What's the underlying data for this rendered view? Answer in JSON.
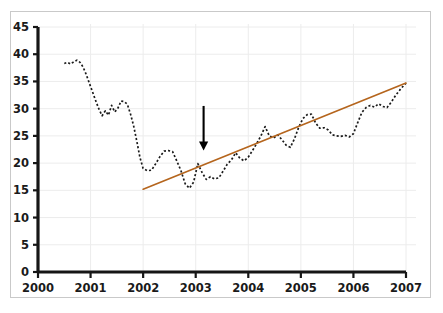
{
  "chart_data": {
    "type": "line",
    "title": "",
    "subtitle": "",
    "xlabel": "",
    "ylabel": "",
    "xlim": [
      2000,
      2007
    ],
    "ylim": [
      0,
      45
    ],
    "grid": true,
    "legend": "none",
    "x_ticks": [
      "2000",
      "2001",
      "2002",
      "2003",
      "2004",
      "2005",
      "2006",
      "2007"
    ],
    "y_ticks": [
      "0",
      "5",
      "10",
      "15",
      "20",
      "25",
      "30",
      "35",
      "40",
      "45"
    ],
    "series": [
      {
        "name": "data-series",
        "style": "dotted",
        "color": "#1a1a1a",
        "x": [
          2000.5,
          2000.56,
          2000.62,
          2000.68,
          2000.74,
          2000.8,
          2000.86,
          2000.92,
          2000.98,
          2001.04,
          2001.1,
          2001.16,
          2001.22,
          2001.28,
          2001.34,
          2001.4,
          2001.46,
          2001.52,
          2001.58,
          2001.64,
          2001.7,
          2001.76,
          2001.82,
          2001.88,
          2001.94,
          2002.0,
          2002.08,
          2002.16,
          2002.24,
          2002.32,
          2002.4,
          2002.48,
          2002.56,
          2002.64,
          2002.72,
          2002.8,
          2002.88,
          2002.96,
          2003.04,
          2003.12,
          2003.2,
          2003.28,
          2003.36,
          2003.44,
          2003.52,
          2003.6,
          2003.68,
          2003.76,
          2003.84,
          2003.92,
          2004.0,
          2004.08,
          2004.16,
          2004.24,
          2004.32,
          2004.4,
          2004.48,
          2004.56,
          2004.64,
          2004.72,
          2004.8,
          2004.88,
          2004.96,
          2005.04,
          2005.12,
          2005.2,
          2005.28,
          2005.36,
          2005.44,
          2005.52,
          2005.6,
          2005.68,
          2005.76,
          2005.84,
          2005.92,
          2006.0,
          2006.08,
          2006.16,
          2006.24,
          2006.32,
          2006.4,
          2006.48,
          2006.56,
          2006.64,
          2006.72,
          2006.8,
          2006.88,
          2006.96,
          2007.0
        ],
        "y": [
          38.3,
          38.5,
          38.2,
          38.6,
          38.9,
          38.5,
          37.6,
          36.2,
          34.6,
          33.0,
          31.4,
          29.9,
          28.7,
          29.6,
          28.8,
          30.6,
          29.4,
          30.1,
          31.4,
          31.3,
          30.8,
          29.0,
          26.8,
          24.0,
          21.0,
          19.0,
          18.6,
          18.7,
          19.9,
          21.2,
          22.2,
          22.3,
          22.1,
          20.4,
          18.6,
          16.2,
          15.4,
          16.5,
          19.9,
          18.3,
          17.0,
          17.5,
          17.1,
          17.3,
          18.5,
          19.8,
          20.6,
          21.9,
          20.9,
          20.4,
          21.1,
          22.3,
          23.6,
          25.0,
          26.7,
          25.0,
          24.6,
          25.2,
          24.3,
          23.3,
          22.9,
          24.5,
          26.6,
          28.2,
          28.9,
          29.0,
          27.4,
          26.4,
          26.5,
          26.1,
          25.2,
          25.0,
          24.9,
          25.1,
          24.8,
          25.4,
          27.4,
          29.3,
          30.2,
          30.6,
          30.3,
          30.9,
          30.4,
          30.2,
          31.2,
          32.4,
          33.4,
          34.3,
          34.7
        ]
      }
    ],
    "trendline": {
      "name": "linear-trendline",
      "color": "#b5651d",
      "x_start": 2002.0,
      "y_start": 15.2,
      "x_end": 2007.0,
      "y_end": 34.7
    },
    "annotations": [
      {
        "type": "arrow",
        "name": "downward-arrow-annotation",
        "color": "#000000",
        "x": 2003.15,
        "y_tail": 30.5,
        "y_head": 22.3,
        "direction": "down"
      }
    ]
  }
}
